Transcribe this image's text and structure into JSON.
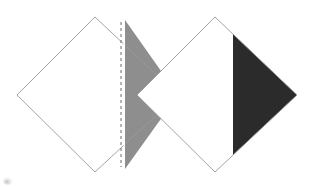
{
  "diagram": {
    "background_color": "#ffffff",
    "canvas": {
      "width": 315,
      "height": 186
    },
    "colors": {
      "paper_fill": "#ffffff",
      "outline_stroke": "#9a9a9a",
      "fold_flap_gray": "#8e8e8e",
      "fold_flap_dark": "#2b2b2b",
      "dashed_fold_line": "#5a5a5a",
      "smudge": "#bdbdbd"
    },
    "shapes": [
      {
        "name": "left-diamond",
        "label": "Left diamond with gray folded flap",
        "vertices": {
          "top": [
            95,
            17
          ],
          "right": [
            178,
            95
          ],
          "bottom": [
            95,
            172
          ],
          "left": [
            17,
            95
          ]
        },
        "fill": "#ffffff",
        "stroke": "#9a9a9a",
        "flap": {
          "name": "gray-flap",
          "label": "Gray folded flap (right portion)",
          "fill": "#8e8e8e",
          "fold_x": 125,
          "points": "125,20 178,95 125,169"
        },
        "fold_line": {
          "name": "dashed-fold-line",
          "label": "Dashed valley fold line",
          "x": 121,
          "y_top": 22,
          "y_bottom": 167,
          "dash_pattern": "3 3",
          "color": "#5a5a5a"
        }
      },
      {
        "name": "right-diamond",
        "label": "Right diamond with dark folded flap",
        "vertices": {
          "top": [
            215,
            17
          ],
          "right": [
            297,
            95
          ],
          "bottom": [
            215,
            172
          ],
          "left": [
            137,
            95
          ]
        },
        "fill": "#ffffff",
        "stroke": "#9a9a9a",
        "flap": {
          "name": "dark-flap",
          "label": "Dark folded flap (right portion)",
          "fill": "#2b2b2b",
          "fold_x": 233,
          "points": "233,34 297,95 233,155"
        },
        "fold_line": null
      }
    ],
    "artifacts": [
      {
        "name": "corner-smudge",
        "label": "Faint gray smudge in lower-left corner",
        "position": [
          3,
          177
        ]
      }
    ]
  }
}
